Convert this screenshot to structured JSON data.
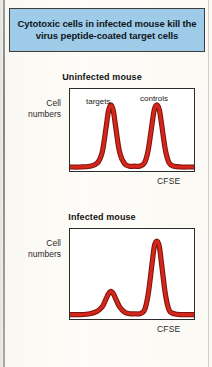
{
  "figure": {
    "title": "Cytotoxic cells in infected mouse kill the virus peptide-coated target cells",
    "banner_color": "#9DCBE8",
    "curve_color": "#D4261A",
    "page_background": "#F7F4EC"
  },
  "charts": {
    "top": {
      "heading": "Uninfected mouse",
      "ylabel_line1": "Cell",
      "ylabel_line2": "numbers",
      "xlabel": "CFSE",
      "peak_labels": {
        "left": "targets",
        "right": "controls"
      }
    },
    "bottom": {
      "heading": "Infected mouse",
      "ylabel_line1": "Cell",
      "ylabel_line2": "numbers",
      "xlabel": "CFSE"
    }
  },
  "chart_data": [
    {
      "type": "line",
      "title": "Uninfected mouse",
      "xlabel": "CFSE",
      "ylabel": "Cell numbers",
      "grid": false,
      "legend": "inline-annotations",
      "xlim": [
        0,
        100
      ],
      "ylim": [
        0,
        100
      ],
      "annotations": [
        "targets",
        "controls"
      ],
      "series": [
        {
          "name": "cell number distribution",
          "peaks": [
            {
              "label": "targets",
              "center": 33,
              "height": 82,
              "width": 9
            },
            {
              "label": "controls",
              "center": 70,
              "height": 82,
              "width": 9
            }
          ],
          "x": [
            0,
            8,
            16,
            22,
            26,
            29,
            31,
            33,
            35,
            37,
            40,
            44,
            48,
            52,
            56,
            60,
            63,
            66,
            68,
            70,
            72,
            74,
            77,
            80,
            84,
            90,
            96,
            100
          ],
          "y": [
            3,
            3,
            4,
            8,
            22,
            52,
            74,
            82,
            74,
            52,
            22,
            7,
            4,
            4,
            4,
            8,
            24,
            56,
            76,
            82,
            76,
            56,
            24,
            8,
            4,
            3,
            3,
            3
          ]
        }
      ]
    },
    {
      "type": "line",
      "title": "Infected mouse",
      "xlabel": "CFSE",
      "ylabel": "Cell numbers",
      "grid": false,
      "legend": "none",
      "xlim": [
        0,
        100
      ],
      "ylim": [
        0,
        100
      ],
      "annotations": [],
      "series": [
        {
          "name": "cell number distribution",
          "peaks": [
            {
              "label": "targets",
              "center": 33,
              "height": 30,
              "width": 9
            },
            {
              "label": "controls",
              "center": 70,
              "height": 88,
              "width": 9
            }
          ],
          "x": [
            0,
            8,
            16,
            22,
            26,
            29,
            31,
            33,
            35,
            37,
            40,
            44,
            48,
            52,
            56,
            60,
            63,
            66,
            68,
            70,
            72,
            74,
            77,
            80,
            84,
            90,
            96,
            100
          ],
          "y": [
            3,
            3,
            4,
            7,
            12,
            21,
            27,
            30,
            27,
            21,
            12,
            6,
            4,
            4,
            4,
            8,
            26,
            60,
            82,
            88,
            82,
            60,
            26,
            8,
            4,
            3,
            3,
            3
          ]
        }
      ]
    }
  ]
}
